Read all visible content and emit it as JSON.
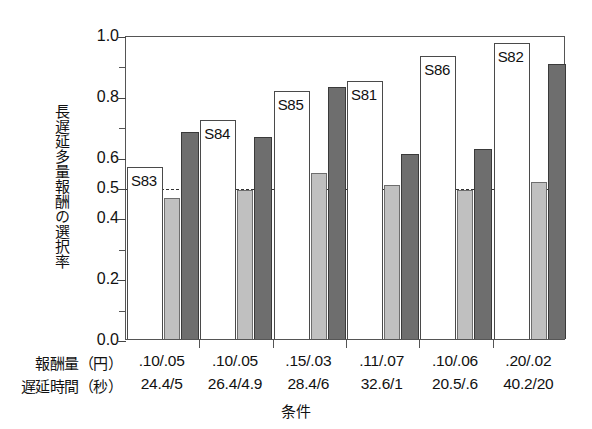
{
  "chart_data": {
    "type": "bar",
    "title": "",
    "xlabel": "条件",
    "ylabel": "長遅延多量報酬の選択率",
    "ylim": [
      0.0,
      1.0
    ],
    "yticks": [
      "1.0",
      "0.8",
      "0.6",
      "0.5",
      "0.4",
      "0.2",
      "0.0"
    ],
    "ytick_values": [
      1.0,
      0.8,
      0.6,
      0.5,
      0.4,
      0.2,
      0.0
    ],
    "minor_ytick_values": [
      0.9,
      0.7,
      0.3,
      0.1
    ],
    "grid": false,
    "legend": "none",
    "reference_line": 0.5,
    "reference_line_style": "dashed",
    "categories": [
      "S83",
      "S84",
      "S85",
      "S81",
      "S86",
      "S82"
    ],
    "series": [
      {
        "name": "white",
        "color": "#ffffff",
        "values": [
          0.565,
          0.72,
          0.815,
          0.85,
          0.93,
          0.975
        ]
      },
      {
        "name": "light-gray",
        "color": "#c0c0c0",
        "values": [
          0.465,
          0.49,
          0.545,
          0.505,
          0.49,
          0.515
        ]
      },
      {
        "name": "dark-gray",
        "color": "#6e6e6e",
        "values": [
          0.68,
          0.665,
          0.83,
          0.61,
          0.625,
          0.905
        ]
      }
    ],
    "row_labels": [
      "報酬量（円）",
      "遅延時間（秒）"
    ],
    "reward_amounts": [
      ".10/.05",
      ".10/.05",
      ".15/.03",
      ".11/.07",
      ".10/.06",
      ".20/.02"
    ],
    "delay_times": [
      "24.4/5",
      "26.4/4.9",
      "28.4/6",
      "32.6/1",
      "20.5/.6",
      "40.2/20"
    ]
  },
  "axis": {
    "y_label_text": "長遅延多量報酬の選択率",
    "x_title": "条件"
  },
  "colors": {
    "white_bar": "#ffffff",
    "light_bar": "#c0c0c0",
    "dark_bar": "#6e6e6e",
    "frame": "#555555",
    "text": "#111111"
  }
}
